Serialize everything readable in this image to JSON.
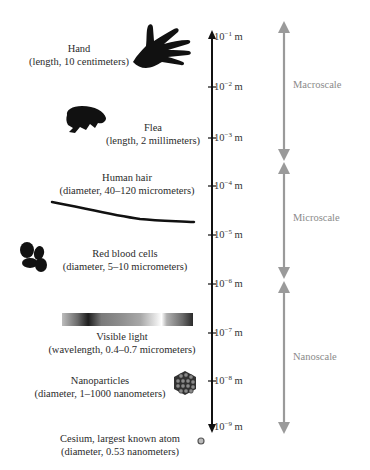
{
  "diagram": {
    "title": "",
    "axis": {
      "ticks": [
        {
          "exp": "−1",
          "unit": "m",
          "y": 37
        },
        {
          "exp": "−2",
          "unit": "m",
          "y": 87
        },
        {
          "exp": "−3",
          "unit": "m",
          "y": 138
        },
        {
          "exp": "−4",
          "unit": "m",
          "y": 186
        },
        {
          "exp": "−5",
          "unit": "m",
          "y": 235
        },
        {
          "exp": "−6",
          "unit": "m",
          "y": 284
        },
        {
          "exp": "−7",
          "unit": "m",
          "y": 333
        },
        {
          "exp": "−8",
          "unit": "m",
          "y": 381
        },
        {
          "exp": "−9",
          "unit": "m",
          "y": 427
        }
      ]
    },
    "scales": [
      {
        "label": "Macroscale",
        "from": "10^-1 m",
        "to": "10^-3 m"
      },
      {
        "label": "Microscale",
        "from": "10^-3 m",
        "to": "10^-6 m"
      },
      {
        "label": "Nanoscale",
        "from": "10^-6 m",
        "to": "10^-9 m"
      }
    ],
    "objects": [
      {
        "name": "Hand",
        "detail": "(length, 10 centimeters)",
        "icon": "hand-icon"
      },
      {
        "name": "Flea",
        "detail": "(length, 2 millimeters)",
        "icon": "flea-icon"
      },
      {
        "name": "Human hair",
        "detail": "(diameter, 40–120 micrometers)",
        "icon": "hair-strand-icon"
      },
      {
        "name": "Red blood cells",
        "detail": "(diameter, 5–10 micrometers)",
        "icon": "red-blood-cells-icon"
      },
      {
        "name": "Visible light",
        "detail": "(wavelength, 0.4–0.7 micrometers)",
        "icon": "light-spectrum-icon"
      },
      {
        "name": "Nanoparticles",
        "detail": "(diameter, 1–1000 nanometers)",
        "icon": "nanoparticle-cluster-icon"
      },
      {
        "name": "Cesium, largest known atom",
        "detail": "(diameter, 0.53 nanometers)",
        "icon": "atom-icon"
      }
    ],
    "tick_base": "10",
    "colors": {
      "axis": "#111111",
      "scale_arrow": "#9a9a9a",
      "scale_text": "#8a8a8a"
    }
  }
}
